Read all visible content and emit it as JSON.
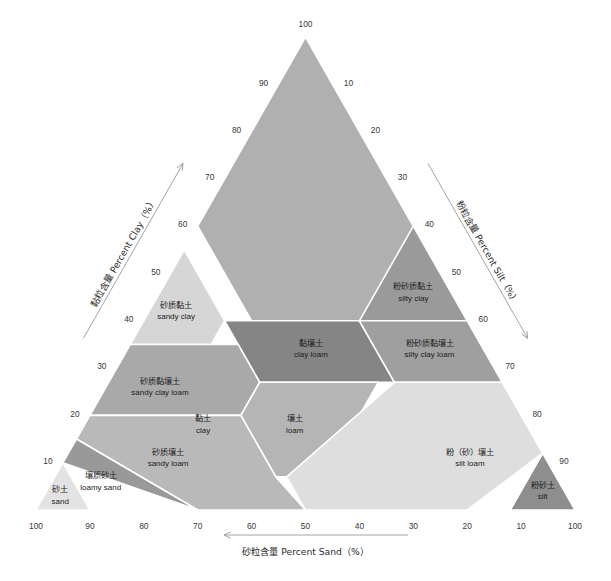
{
  "figure": {
    "type": "soil-texture-triangle",
    "background_color": "#ffffff"
  },
  "chart_data": {
    "type": "diagram",
    "title": "",
    "subtitle": "",
    "grid": false,
    "legend_position": "none",
    "axes": [
      {
        "id": "clay",
        "title_cn": "黏粒含量",
        "title_en": "Percent Clay",
        "title_unit": "（%）",
        "title_full": "黏粒含量 Percent Clay（%）",
        "position": "left",
        "direction": "up",
        "range": [
          0,
          100
        ],
        "ticks": [
          "10",
          "20",
          "30",
          "40",
          "50",
          "60",
          "70",
          "80",
          "90",
          "100"
        ]
      },
      {
        "id": "silt",
        "title_cn": "粉粒含量",
        "title_en": "Percent Silt",
        "title_unit": "（%）",
        "title_full": "粉粒含量 Percent Silt（%）",
        "position": "right",
        "direction": "down-right",
        "range": [
          0,
          100
        ],
        "ticks": [
          "10",
          "20",
          "30",
          "40",
          "50",
          "60",
          "70",
          "80",
          "90",
          "100"
        ]
      },
      {
        "id": "sand",
        "title_cn": "砂粒含量",
        "title_en": "Percent Sand",
        "title_unit": "（%）",
        "title_full": "砂粒含量 Percent Sand（%）",
        "position": "bottom",
        "direction": "left",
        "range": [
          0,
          100
        ],
        "ticks": [
          "100",
          "90",
          "80",
          "70",
          "60",
          "50",
          "40",
          "30",
          "20",
          "10",
          "100"
        ]
      }
    ],
    "apex_tick": "100",
    "regions": [
      {
        "id": "clay",
        "label_cn": "黏土",
        "label_en": "clay",
        "color": "#b0b0b0",
        "vertices": [
          [
            0,
            100,
            0
          ],
          [
            40,
            60,
            0
          ],
          [
            40,
            40,
            20
          ],
          [
            20,
            40,
            40
          ],
          [
            0,
            55,
            45
          ]
        ],
        "label_point": [
          60,
          18,
          22
        ]
      },
      {
        "id": "silty-clay",
        "label_cn": "粉砂质黏土",
        "label_en": "silty clay",
        "color": "#9a9a9a",
        "vertices": [
          [
            0,
            40,
            60
          ],
          [
            0,
            60,
            40
          ],
          [
            20,
            40,
            40
          ]
        ],
        "label_point": [
          7,
          46,
          47
        ]
      },
      {
        "id": "sandy-clay",
        "label_cn": "砂质黏土",
        "label_en": "sandy clay",
        "color": "#d6d6d6",
        "vertices": [
          [
            45,
            55,
            0
          ],
          [
            65,
            35,
            0
          ],
          [
            50,
            35,
            15
          ],
          [
            45,
            40,
            15
          ]
        ],
        "label_point": [
          53,
          42,
          5
        ]
      },
      {
        "id": "clay-loam",
        "label_cn": "黏壤土",
        "label_en": "clay loam",
        "color": "#858585",
        "vertices": [
          [
            45,
            40,
            15
          ],
          [
            20,
            40,
            40
          ],
          [
            20,
            27,
            53
          ],
          [
            45,
            27,
            28
          ]
        ],
        "label_point": [
          32,
          34,
          34
        ]
      },
      {
        "id": "silty-clay-loam",
        "label_cn": "粉砂质黏壤土",
        "label_en": "silty clay loam",
        "color": "#9f9f9f",
        "vertices": [
          [
            20,
            40,
            40
          ],
          [
            0,
            40,
            60
          ],
          [
            0,
            27,
            73
          ],
          [
            20,
            27,
            53
          ]
        ],
        "label_point": [
          10,
          34,
          56
        ]
      },
      {
        "id": "sandy-clay-loam",
        "label_cn": "砂质黏壤土",
        "label_en": "sandy clay loam",
        "color": "#a9a9a9",
        "vertices": [
          [
            65,
            35,
            0
          ],
          [
            80,
            20,
            0
          ],
          [
            65,
            20,
            15
          ],
          [
            52,
            20,
            28
          ],
          [
            45,
            27,
            28
          ],
          [
            45,
            35,
            20
          ]
        ],
        "label_point": [
          64,
          26,
          10
        ]
      },
      {
        "id": "loam",
        "label_cn": "壤土",
        "label_en": "loam",
        "color": "#b5b5b5",
        "vertices": [
          [
            45,
            27,
            28
          ],
          [
            52,
            20,
            28
          ],
          [
            52,
            7,
            41
          ],
          [
            43,
            7,
            50
          ],
          [
            23,
            27,
            50
          ]
        ],
        "label_point": [
          43,
          18,
          39
        ]
      },
      {
        "id": "silt-loam",
        "label_cn": "粉（砂）壤土",
        "label_en": "silt loam",
        "color": "#dedede",
        "vertices": [
          [
            20,
            27,
            53
          ],
          [
            0,
            27,
            73
          ],
          [
            0,
            12,
            88
          ],
          [
            20,
            0,
            80
          ],
          [
            50,
            0,
            50
          ],
          [
            50,
            7,
            43
          ]
        ],
        "label_point": [
          14,
          11,
          75
        ]
      },
      {
        "id": "silt",
        "label_cn": "粉砂土",
        "label_en": "silt",
        "color": "#8e8e8e",
        "vertices": [
          [
            0,
            12,
            88
          ],
          [
            12,
            0,
            88
          ],
          [
            0,
            0,
            100
          ]
        ],
        "label_point": [
          4,
          4,
          92
        ]
      },
      {
        "id": "sandy-loam",
        "label_cn": "砂质壤土",
        "label_en": "sandy loam",
        "color": "#b9b9b9",
        "vertices": [
          [
            80,
            20,
            0
          ],
          [
            85,
            15,
            0
          ],
          [
            70,
            0,
            30
          ],
          [
            50,
            0,
            50
          ],
          [
            52,
            7,
            41
          ],
          [
            52,
            20,
            28
          ],
          [
            65,
            20,
            15
          ]
        ],
        "label_point": [
          70,
          11,
          19
        ]
      },
      {
        "id": "loamy-sand",
        "label_cn": "壤质砂土",
        "label_en": "loamy sand",
        "color": "#999999",
        "vertices": [
          [
            85,
            15,
            0
          ],
          [
            90,
            10,
            0
          ],
          [
            70,
            0,
            30
          ]
        ],
        "label_point": [
          85,
          6,
          9
        ]
      },
      {
        "id": "sand",
        "label_cn": "砂土",
        "label_en": "sand",
        "color": "#e3e3e3",
        "vertices": [
          [
            90,
            10,
            0
          ],
          [
            100,
            0,
            0
          ],
          [
            90,
            0,
            10
          ]
        ],
        "label_point": [
          94,
          3,
          3
        ]
      }
    ]
  }
}
